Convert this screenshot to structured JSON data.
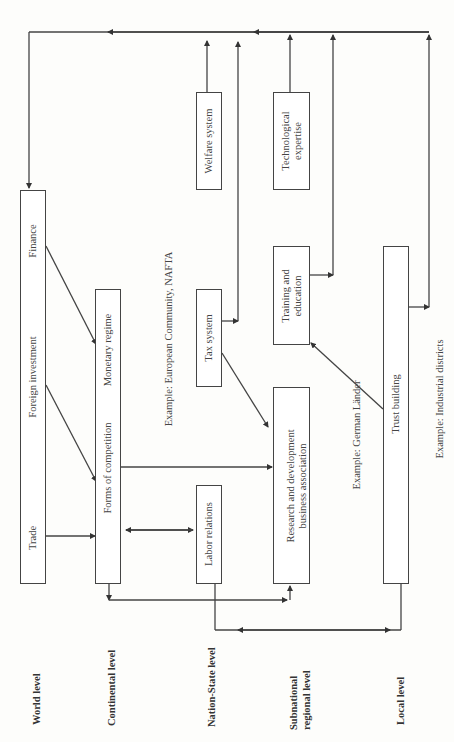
{
  "levels": {
    "world": "World level",
    "continental": "Continental level",
    "nation_state": "Nation-State level",
    "subnational_1": "Subnational",
    "subnational_2": "regional level",
    "local": "Local level"
  },
  "boxes": {
    "world": {
      "items": [
        "Trade",
        "Foreign investment",
        "Finance"
      ]
    },
    "continental": {
      "items": [
        "Forms of competition",
        "Monetary regime"
      ]
    },
    "labor_relations": "Labor relations",
    "tax_system": "Tax system",
    "welfare_system": "Welfare system",
    "research_1": "Research and development",
    "research_2": "business association",
    "training_1": "Training and",
    "training_2": "education",
    "tech_1": "Technological",
    "tech_2": "expertise",
    "trust_building": "Trust building"
  },
  "examples": {
    "continental": "Example: European Community, NAFTA",
    "subnational": "Example: German Länder",
    "local": "Example: Industrial districts"
  }
}
